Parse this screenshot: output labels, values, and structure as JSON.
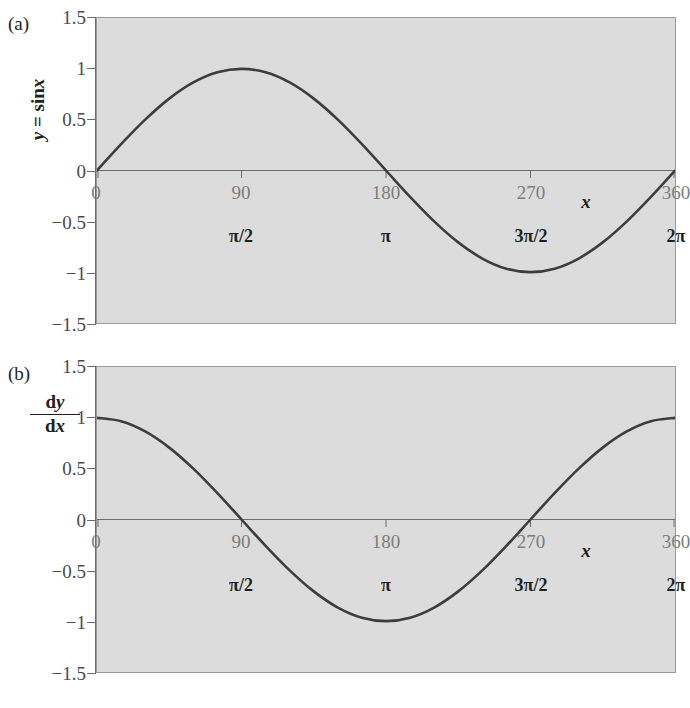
{
  "figure": {
    "background": "#ffffff",
    "plot_fill": "#dcdcdc",
    "curve_color": "#3d3d3d",
    "axis_color": "#6b6b6b",
    "tick_label_color": "#7d7d7d"
  },
  "panels": [
    {
      "index_label": "(a)",
      "y_axis_title_parts": {
        "var": "y",
        "eq": " = sin",
        "arg": "x"
      },
      "y_axis_title_text": "y = sinx"
    },
    {
      "index_label": "(b)",
      "fraction": {
        "numerator_d": "d",
        "numerator_var": "y",
        "denominator_d": "d",
        "denominator_var": "x"
      },
      "y_axis_title_text": "dy/dx"
    }
  ],
  "chart_data": [
    {
      "type": "line",
      "title": "(a)",
      "function": "y = sin x",
      "xlabel": "x",
      "ylabel": "y = sinx",
      "xlim": [
        0,
        360
      ],
      "ylim": [
        -1.5,
        1.5
      ],
      "grid": false,
      "legend": "none",
      "x_ticks": [
        0,
        90,
        180,
        270,
        360
      ],
      "x_tick_labels": [
        "0",
        "90",
        "180",
        "270",
        "360"
      ],
      "x_secondary_labels": [
        "",
        "π/2",
        "π",
        "3π/2",
        "2π"
      ],
      "y_ticks": [
        1.5,
        1,
        0.5,
        0,
        -0.5,
        -1,
        -1.5
      ],
      "y_tick_labels": [
        "1.5",
        "1",
        "0.5",
        "0",
        "−0.5",
        "−1",
        "−1.5"
      ],
      "x": [
        0,
        15,
        30,
        45,
        60,
        75,
        90,
        105,
        120,
        135,
        150,
        165,
        180,
        195,
        210,
        225,
        240,
        255,
        270,
        285,
        300,
        315,
        330,
        345,
        360
      ],
      "values": [
        0,
        0.259,
        0.5,
        0.707,
        0.866,
        0.966,
        1,
        0.966,
        0.866,
        0.707,
        0.5,
        0.259,
        0,
        -0.259,
        -0.5,
        -0.707,
        -0.866,
        -0.966,
        -1,
        -0.966,
        -0.866,
        -0.707,
        -0.5,
        -0.259,
        0
      ],
      "annotations": []
    },
    {
      "type": "line",
      "title": "(b)",
      "function": "dy/dx = cos x",
      "xlabel": "x",
      "ylabel": "dy/dx",
      "xlim": [
        0,
        360
      ],
      "ylim": [
        -1.5,
        1.5
      ],
      "grid": false,
      "legend": "none",
      "x_ticks": [
        0,
        90,
        180,
        270,
        360
      ],
      "x_tick_labels": [
        "0",
        "90",
        "180",
        "270",
        "360"
      ],
      "x_secondary_labels": [
        "",
        "π/2",
        "π",
        "3π/2",
        "2π"
      ],
      "y_ticks": [
        1.5,
        1,
        0.5,
        0,
        -0.5,
        -1,
        -1.5
      ],
      "y_tick_labels": [
        "1.5",
        "1",
        "0.5",
        "0",
        "−0.5",
        "−1",
        "−1.5"
      ],
      "x": [
        0,
        15,
        30,
        45,
        60,
        75,
        90,
        105,
        120,
        135,
        150,
        165,
        180,
        195,
        210,
        225,
        240,
        255,
        270,
        285,
        300,
        315,
        330,
        345,
        360
      ],
      "values": [
        1,
        0.966,
        0.866,
        0.707,
        0.5,
        0.259,
        0,
        -0.259,
        -0.5,
        -0.707,
        -0.866,
        -0.966,
        -1,
        -0.966,
        -0.866,
        -0.707,
        -0.5,
        -0.259,
        0,
        0.259,
        0.5,
        0.707,
        0.866,
        0.966,
        1
      ],
      "annotations": []
    }
  ]
}
